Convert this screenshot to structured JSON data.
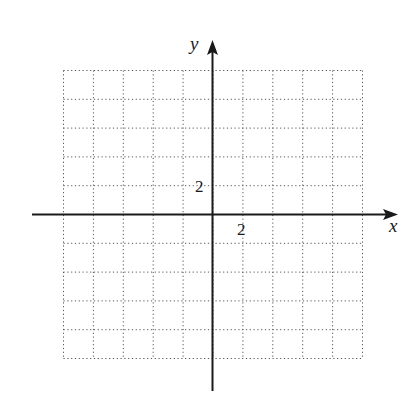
{
  "diagram": {
    "type": "coordinate-plane",
    "grid": {
      "columns": 10,
      "rows": 10,
      "style": "dotted",
      "color": "#555555",
      "x_range": [
        -10,
        10
      ],
      "y_range": [
        -10,
        10
      ],
      "cell_units": 2
    },
    "axes": {
      "x_label": "x",
      "y_label": "y",
      "color": "#1a1a1a"
    },
    "tick_labels": {
      "x_tick": "2",
      "y_tick": "2"
    }
  }
}
